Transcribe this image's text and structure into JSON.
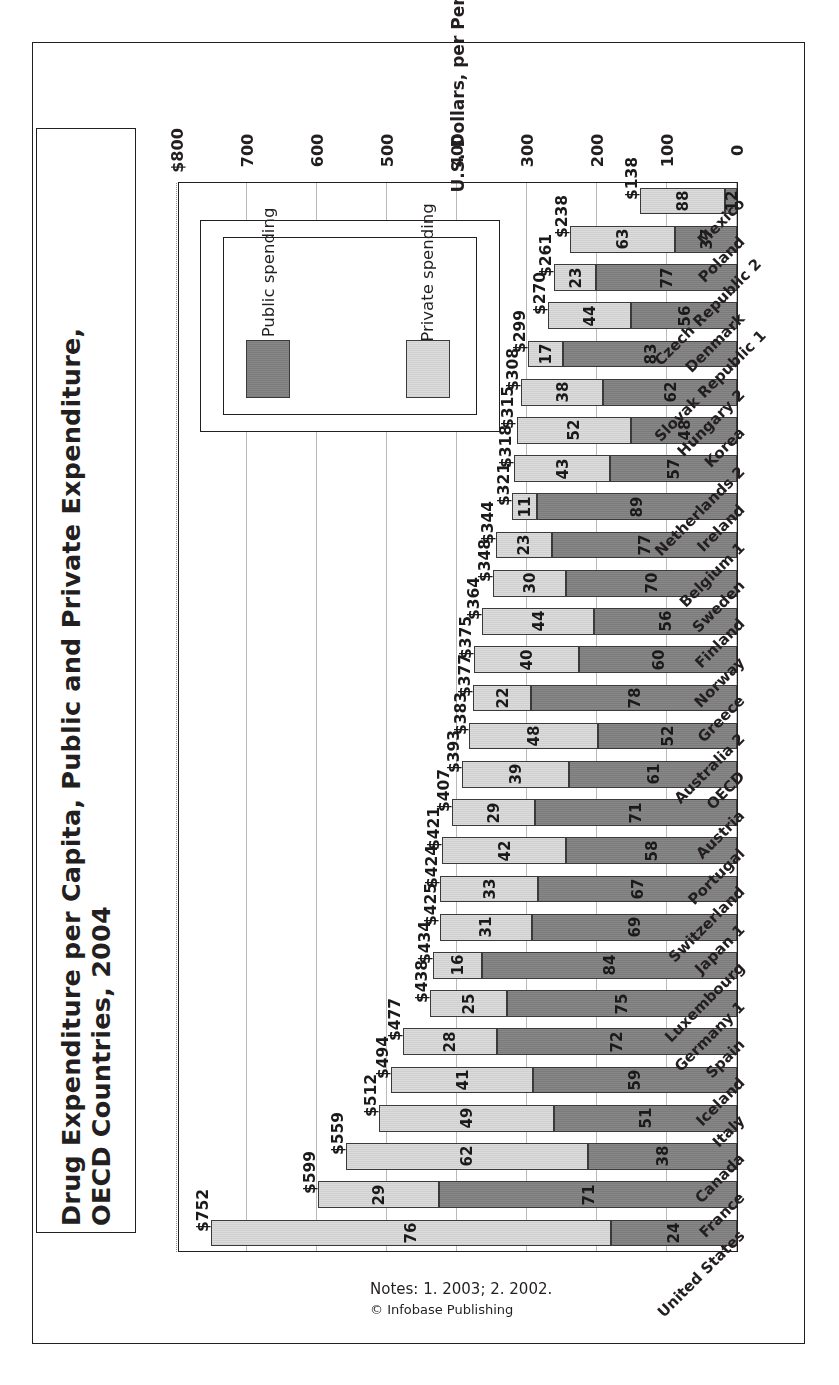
{
  "figure": {
    "title": "Drug Expenditure per Capita, Public and Private Expenditure, OECD Countries, 2004",
    "title_line1": "Drug Expenditure per Capita, Public and Private Expenditure,",
    "title_line2": "OECD Countries, 2004",
    "notes": "Notes: 1. 2003; 2. 2002.",
    "credit": "© Infobase Publishing"
  },
  "legend": {
    "position": "inside-plot",
    "items": [
      {
        "label": "Public spending",
        "color": "#7b7b7b",
        "key": "public"
      },
      {
        "label": "Private spending",
        "color": "#cfcfcf",
        "key": "private"
      }
    ]
  },
  "chart_data": {
    "type": "bar",
    "orientation": "horizontal-stacked-100pct-with-total",
    "title": "Drug Expenditure per Capita, Public and Private Expenditure, OECD Countries, 2004",
    "xlabel": "",
    "ylabel": "U.S. Dollars, per Person",
    "ylim": [
      0,
      800
    ],
    "grid": true,
    "tick_labels": [
      "$800",
      "700",
      "600",
      "500",
      "400",
      "300",
      "200",
      "100",
      "0"
    ],
    "tick_values": [
      800,
      700,
      600,
      500,
      400,
      300,
      200,
      100,
      0
    ],
    "legend_position": "inside-upper-right",
    "categories": [
      "United States",
      "France",
      "Canada",
      "Italy",
      "Iceland",
      "Spain",
      "Germany 1",
      "Luxembourg",
      "Japan 1",
      "Switzerland",
      "Portugal",
      "Austria",
      "OECD",
      "Australia 2",
      "Greece",
      "Norway",
      "Finland",
      "Sweden",
      "Belgium 1",
      "Ireland",
      "Netherlands 2",
      "Korea",
      "Hungary 2",
      "Slovak Republic 1",
      "Denmark",
      "Czech Republic 2",
      "Poland",
      "Mexico"
    ],
    "totals": [
      752,
      599,
      559,
      512,
      494,
      477,
      438,
      434,
      425,
      424,
      421,
      407,
      393,
      383,
      377,
      375,
      364,
      348,
      344,
      321,
      318,
      315,
      308,
      299,
      270,
      261,
      238,
      138
    ],
    "total_labels": [
      "$752",
      "$599",
      "$559",
      "$512",
      "$494",
      "$477",
      "$438",
      "$434",
      "$425",
      "$424",
      "$421",
      "$407",
      "$393",
      "$383",
      "$377",
      "$375",
      "$364",
      "$348",
      "$344",
      "$321",
      "$318",
      "$315",
      "$308",
      "$299",
      "$270",
      "$261",
      "$238",
      "$138"
    ],
    "series": [
      {
        "name": "Public spending",
        "unit": "percent",
        "values": [
          24,
          71,
          38,
          51,
          59,
          72,
          75,
          84,
          69,
          67,
          58,
          71,
          61,
          52,
          78,
          60,
          56,
          70,
          77,
          89,
          57,
          48,
          62,
          83,
          56,
          77,
          37,
          12
        ]
      },
      {
        "name": "Private spending",
        "unit": "percent",
        "values": [
          76,
          29,
          62,
          49,
          41,
          28,
          25,
          16,
          31,
          33,
          42,
          29,
          39,
          48,
          22,
          40,
          44,
          30,
          23,
          11,
          43,
          52,
          38,
          17,
          44,
          23,
          63,
          88
        ]
      }
    ]
  }
}
